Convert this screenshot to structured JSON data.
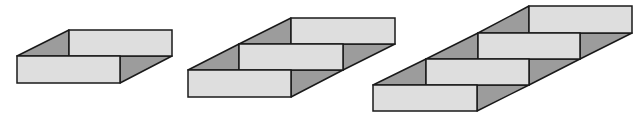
{
  "figure": {
    "colors": {
      "background": "#ffffff",
      "face_light": "#dedede",
      "face_dark": "#9c9c9c",
      "stroke": "#1a1a1a"
    },
    "shapes": [
      {
        "name": "two-slab-structure",
        "slab_count": 2,
        "slabs": [
          {
            "x": 17,
            "y": 56,
            "w": 103,
            "h": 27
          },
          {
            "x": 69,
            "y": 30,
            "w": 103,
            "h": 26
          }
        ]
      },
      {
        "name": "three-slab-structure",
        "slab_count": 3,
        "slabs": [
          {
            "x": 188,
            "y": 70,
            "w": 103,
            "h": 27
          },
          {
            "x": 239,
            "y": 44,
            "w": 104,
            "h": 26
          },
          {
            "x": 291,
            "y": 18,
            "w": 104,
            "h": 26
          }
        ]
      },
      {
        "name": "four-slab-structure",
        "slab_count": 4,
        "slabs": [
          {
            "x": 373,
            "y": 85,
            "w": 104,
            "h": 26
          },
          {
            "x": 426,
            "y": 59,
            "w": 103,
            "h": 26
          },
          {
            "x": 478,
            "y": 33,
            "w": 102,
            "h": 26
          },
          {
            "x": 529,
            "y": 6,
            "w": 103,
            "h": 27
          }
        ]
      }
    ]
  }
}
